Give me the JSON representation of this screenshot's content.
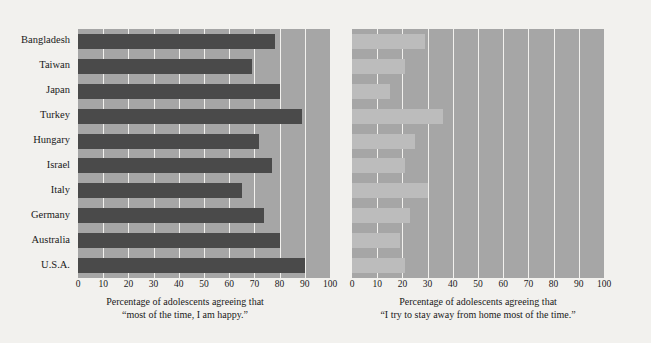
{
  "figure": {
    "background_color": "#f2f1ee",
    "plot_background_color": "#a6a6a6",
    "gridline_color": "#f2f1ee"
  },
  "chart_data": [
    {
      "type": "bar",
      "orientation": "horizontal",
      "panel": "left",
      "title": "",
      "xlabel": "Percentage of adolescents agreeing that “most of the time, I am happy.”",
      "ylabel": "",
      "xlim": [
        0,
        100
      ],
      "xticks": [
        0,
        10,
        20,
        30,
        40,
        50,
        60,
        70,
        80,
        90,
        100
      ],
      "grid": true,
      "legend": "none",
      "bar_color": "#4a4a4a",
      "caption_line1": "Percentage of adolescents agreeing that",
      "caption_line2": "“most of the time, I am happy.”",
      "categories": [
        "Bangladesh",
        "Taiwan",
        "Japan",
        "Turkey",
        "Hungary",
        "Israel",
        "Italy",
        "Germany",
        "Australia",
        "U.S.A."
      ],
      "values": [
        78,
        69,
        80,
        89,
        72,
        77,
        65,
        74,
        80,
        90
      ]
    },
    {
      "type": "bar",
      "orientation": "horizontal",
      "panel": "right",
      "title": "",
      "xlabel": "Percentage of adolescents agreeing that “I try to stay away from home most of the time.”",
      "ylabel": "",
      "xlim": [
        0,
        100
      ],
      "xticks": [
        0,
        10,
        20,
        30,
        40,
        50,
        60,
        70,
        80,
        90,
        100
      ],
      "grid": true,
      "legend": "none",
      "bar_color": "#bcbcbc",
      "caption_line1": "Percentage of adolescents agreeing that",
      "caption_line2": "“I try to stay away from home most of the time.”",
      "categories": [
        "Bangladesh",
        "Taiwan",
        "Japan",
        "Turkey",
        "Hungary",
        "Israel",
        "Italy",
        "Germany",
        "Australia",
        "U.S.A."
      ],
      "values": [
        29,
        21,
        15,
        36,
        25,
        21,
        30,
        23,
        19,
        21
      ]
    }
  ]
}
